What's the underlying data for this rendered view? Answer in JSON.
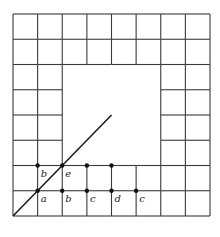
{
  "diagram": {
    "grid": {
      "columns": 8,
      "rows": 8,
      "hollow_block": {
        "col_start": 2,
        "col_end": 6,
        "row_start": 2,
        "row_end": 6
      }
    },
    "diagonal": {
      "from": [
        0,
        0
      ],
      "to": [
        4,
        4
      ]
    },
    "points": [
      {
        "gx": 1,
        "gy": 2,
        "label": "b"
      },
      {
        "gx": 2,
        "gy": 2,
        "label": "e"
      },
      {
        "gx": 3,
        "gy": 2,
        "label": ""
      },
      {
        "gx": 4,
        "gy": 2,
        "label": ""
      },
      {
        "gx": 1,
        "gy": 1,
        "label": "a"
      },
      {
        "gx": 2,
        "gy": 1,
        "label": "b"
      },
      {
        "gx": 3,
        "gy": 1,
        "label": "c"
      },
      {
        "gx": 4,
        "gy": 1,
        "label": "d"
      },
      {
        "gx": 5,
        "gy": 1,
        "label": "c"
      }
    ],
    "colors": {
      "line": "#3a3a3a",
      "point": "#111111"
    }
  }
}
